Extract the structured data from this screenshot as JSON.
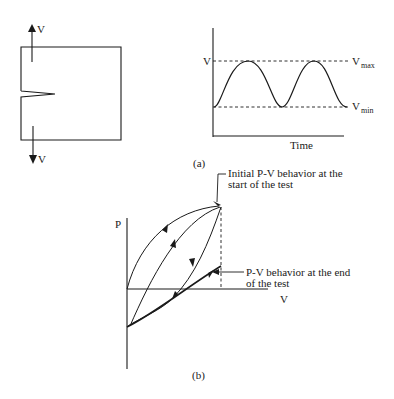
{
  "panel_a": {
    "specimen": {
      "load_top_label": "V",
      "load_bottom_label": "V"
    },
    "loading_history": {
      "y_axis_label": "V",
      "x_axis_label": "Time",
      "max_label_main": "V",
      "max_label_sub": "max",
      "min_label_main": "V",
      "min_label_sub": "min",
      "cycles": 2
    },
    "caption": "(a)"
  },
  "panel_b": {
    "y_axis_label": "P",
    "x_axis_label": "V",
    "annotation_initial": [
      "Initial P-V behavior at the",
      "start of the test"
    ],
    "annotation_end": [
      "P-V behavior at the end",
      "of the test"
    ],
    "caption": "(b)"
  },
  "colors": {
    "line": "#1a1a1a",
    "background": "#ffffff"
  }
}
